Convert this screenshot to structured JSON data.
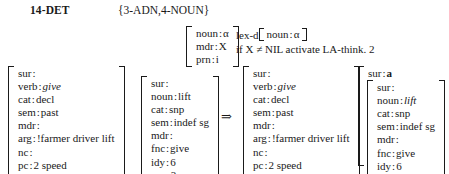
{
  "header": {
    "rule_name": "14-DET",
    "package": "{3-ADN,4-NOUN}"
  },
  "pattern": {
    "rows": [
      {
        "attr": "noun",
        "sep": ":",
        "val": "α"
      },
      {
        "attr": "mdr",
        "sep": ":",
        "val": "X"
      },
      {
        "attr": "prn",
        "sep": ":",
        "val": "i"
      }
    ]
  },
  "operations": {
    "lexd_label": "lex-d",
    "lexd_attr": "noun",
    "lexd_sep": ":",
    "lexd_val": "α",
    "condition": "if X ≠ NIL activate LA-think. 2"
  },
  "derivation": {
    "arrow": "⇒"
  },
  "input": {
    "verb_matrix": {
      "rows": [
        {
          "attr": "sur",
          "sep": ":",
          "val": "",
          "italic": false
        },
        {
          "attr": "verb",
          "sep": ":",
          "val": "give",
          "italic": true
        },
        {
          "attr": "cat",
          "sep": ":",
          "val": "decl",
          "italic": false
        },
        {
          "attr": "sem",
          "sep": ":",
          "val": "past",
          "italic": false
        },
        {
          "attr": "mdr",
          "sep": ":",
          "val": "",
          "italic": false
        },
        {
          "attr": "arg",
          "sep": ":",
          "val": "!farmer driver lift",
          "italic": false
        },
        {
          "attr": "nc",
          "sep": ":",
          "val": "",
          "italic": false
        },
        {
          "attr": "pc",
          "sep": ":",
          "val": "2 speed",
          "italic": false
        },
        {
          "attr": "prn",
          "sep": ":",
          "val": "3",
          "italic": false
        }
      ]
    },
    "noun_matrix": {
      "rows": [
        {
          "attr": "sur",
          "sep": ":",
          "val": "",
          "italic": false
        },
        {
          "attr": "noun",
          "sep": ":",
          "val": "lift",
          "italic": false
        },
        {
          "attr": "cat",
          "sep": ":",
          "val": "snp",
          "italic": false
        },
        {
          "attr": "sem",
          "sep": ":",
          "val": "indef sg",
          "italic": false
        },
        {
          "attr": "mdr",
          "sep": ":",
          "val": "",
          "italic": false
        },
        {
          "attr": "fnc",
          "sep": ":",
          "val": "give",
          "italic": false
        },
        {
          "attr": "idy",
          "sep": ":",
          "val": "6",
          "italic": false
        },
        {
          "attr": "prn",
          "sep": ":",
          "val": "3",
          "italic": false
        }
      ]
    }
  },
  "output": {
    "verb_matrix": {
      "rows": [
        {
          "attr": "sur",
          "sep": ":",
          "val": "",
          "italic": false
        },
        {
          "attr": "verb",
          "sep": ":",
          "val": "give",
          "italic": true
        },
        {
          "attr": "cat",
          "sep": ":",
          "val": "decl",
          "italic": false
        },
        {
          "attr": "sem",
          "sep": ":",
          "val": "past",
          "italic": false
        },
        {
          "attr": "mdr",
          "sep": ":",
          "val": "",
          "italic": false
        },
        {
          "attr": "arg",
          "sep": ":",
          "val": "!farmer driver lift",
          "italic": false
        },
        {
          "attr": "nc",
          "sep": ":",
          "val": "",
          "italic": false
        },
        {
          "attr": "pc",
          "sep": ":",
          "val": "2 speed",
          "italic": false
        },
        {
          "attr": "prn",
          "sep": ":",
          "val": "3",
          "italic": false
        }
      ]
    },
    "surface": {
      "attr": "sur",
      "sep": ":",
      "val": "a"
    },
    "noun_matrix": {
      "rows": [
        {
          "attr": "sur",
          "sep": ":",
          "val": "",
          "italic": false
        },
        {
          "attr": "noun",
          "sep": ":",
          "val": "lift",
          "italic": true
        },
        {
          "attr": "cat",
          "sep": ":",
          "val": "snp",
          "italic": false
        },
        {
          "attr": "sem",
          "sep": ":",
          "val": "indef sg",
          "italic": false
        },
        {
          "attr": "mdr",
          "sep": ":",
          "val": "",
          "italic": false
        },
        {
          "attr": "fnc",
          "sep": ":",
          "val": "give",
          "italic": false
        },
        {
          "attr": "idy",
          "sep": ":",
          "val": "6",
          "italic": false
        },
        {
          "attr": "prn",
          "sep": ":",
          "val": "3",
          "italic": false
        }
      ]
    }
  }
}
